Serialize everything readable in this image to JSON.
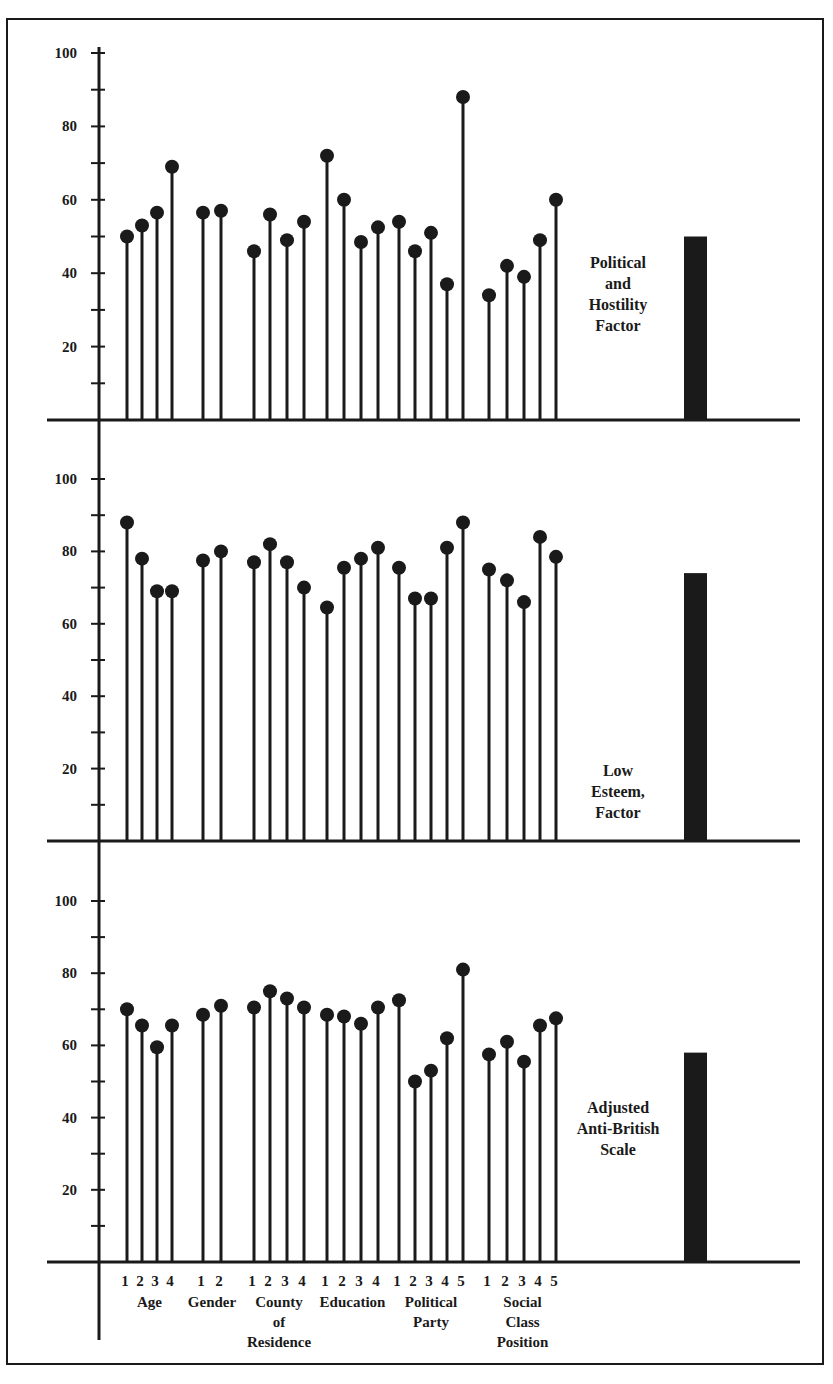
{
  "chart_data": {
    "type": "lollipop",
    "title": "",
    "xlabel": "",
    "ylabel": "",
    "ylim": [
      0,
      100
    ],
    "yticks": [
      20,
      40,
      60,
      80,
      100
    ],
    "grid": false,
    "groups": [
      {
        "name": "Age",
        "label_lines": [
          "Age"
        ],
        "categories": [
          "1",
          "2",
          "3",
          "4"
        ]
      },
      {
        "name": "Gender",
        "label_lines": [
          "Gender"
        ],
        "categories": [
          "1",
          "2"
        ]
      },
      {
        "name": "County of Residence",
        "label_lines": [
          "County",
          "of",
          "Residence"
        ],
        "categories": [
          "1",
          "2",
          "3",
          "4"
        ]
      },
      {
        "name": "Education",
        "label_lines": [
          "Education"
        ],
        "categories": [
          "1",
          "2",
          "3",
          "4"
        ]
      },
      {
        "name": "Political Party",
        "label_lines": [
          "Political",
          "Party"
        ],
        "categories": [
          "1",
          "2",
          "3",
          "4",
          "5"
        ]
      },
      {
        "name": "Social Class Position",
        "label_lines": [
          "Social",
          "Class",
          "Position"
        ],
        "categories": [
          "1",
          "2",
          "3",
          "4",
          "5"
        ]
      }
    ],
    "panels": [
      {
        "name": "Political and Hostility Factor",
        "label_lines": [
          "Political",
          "and",
          "Hostility",
          "Factor"
        ],
        "overall_bar": 50,
        "values": {
          "Age": [
            50,
            53,
            56.5,
            69
          ],
          "Gender": [
            56.5,
            57
          ],
          "County of Residence": [
            46,
            56,
            49,
            54
          ],
          "Education": [
            72,
            60,
            48.5,
            52.5
          ],
          "Political Party": [
            54,
            46,
            51,
            37,
            88
          ],
          "Social Class Position": [
            34,
            42,
            39,
            49,
            60
          ]
        }
      },
      {
        "name": "Low Esteem, Factor",
        "label_lines": [
          "Low",
          "Esteem,",
          "Factor"
        ],
        "overall_bar": 74,
        "values": {
          "Age": [
            88,
            78,
            69,
            69
          ],
          "Gender": [
            77.5,
            80
          ],
          "County of Residence": [
            77,
            82,
            77,
            70
          ],
          "Education": [
            64.5,
            75.5,
            78,
            81
          ],
          "Political Party": [
            75.5,
            67,
            67,
            81,
            88
          ],
          "Social Class Position": [
            75,
            72,
            66,
            84,
            78.5
          ]
        }
      },
      {
        "name": "Adjusted Anti-British Scale",
        "label_lines": [
          "Adjusted",
          "Anti-British",
          "Scale"
        ],
        "overall_bar": 58,
        "values": {
          "Age": [
            70,
            65.5,
            59.5,
            65.5
          ],
          "Gender": [
            68.5,
            71
          ],
          "County of Residence": [
            70.5,
            75,
            73,
            70.5
          ],
          "Education": [
            68.5,
            68,
            66,
            70.5
          ],
          "Political Party": [
            72.5,
            50,
            53,
            62,
            81
          ],
          "Social Class Position": [
            57.5,
            61,
            55.5,
            65.5,
            67.5
          ]
        }
      }
    ]
  },
  "layout": {
    "axis_x": 99,
    "axis_left": 47,
    "axis_right": 800,
    "panels_y": [
      {
        "baseline": 420,
        "top100": 53
      },
      {
        "baseline": 841,
        "top100": 479
      },
      {
        "baseline": 1262,
        "top100": 901
      }
    ],
    "stem_x": {
      "Age": [
        127,
        142,
        157,
        172
      ],
      "Gender": [
        203,
        221
      ],
      "County of Residence": [
        254,
        270,
        287,
        304
      ],
      "Education": [
        327,
        344,
        361,
        378
      ],
      "Political Party": [
        399,
        415,
        431,
        447,
        463
      ],
      "Social Class Position": [
        489,
        507,
        524,
        540,
        556
      ]
    },
    "bar_x": 684,
    "bar_w": 23,
    "panel_label_x": 618,
    "panel_label_top": [
      268,
      776,
      1113
    ]
  },
  "colors": {
    "ink": "#1a1a1a",
    "background": "#ffffff"
  }
}
